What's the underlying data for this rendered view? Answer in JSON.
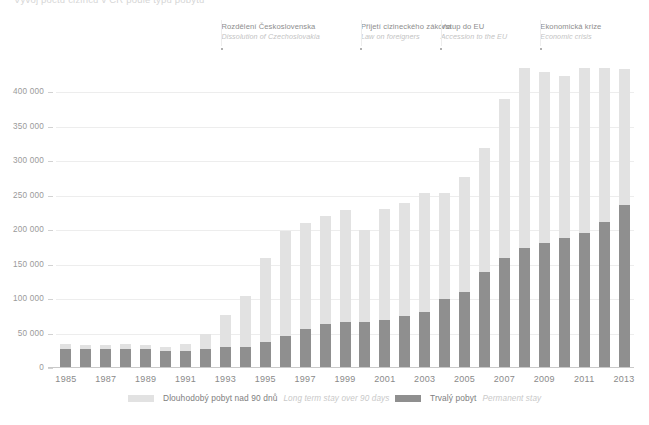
{
  "header": {
    "cutoff_title": "Vývoj počtu cizinců v ČR podle typu pobytu"
  },
  "annotations": [
    {
      "cz": "Rozdělení Československa",
      "en": "Dissolution of Czechoslovakia",
      "year": 1993
    },
    {
      "cz": "Přijetí cizineckého zákona",
      "en": "Law on foreigners",
      "year": 2000
    },
    {
      "cz": "Vstup do EU",
      "en": "Accession to the EU",
      "year": 2004
    },
    {
      "cz": "Ekonomická krize",
      "en": "Economic crisis",
      "year": 2009
    }
  ],
  "legend": {
    "items": [
      {
        "cz": "Dlouhodobý pobyt nad 90 dnů",
        "en": "Long term stay over 90 days",
        "color": "#e2e2e2",
        "key": "long_term"
      },
      {
        "cz": "Trvalý pobyt",
        "en": "Permanent stay",
        "color": "#8f8f8f",
        "key": "permanent"
      }
    ]
  },
  "colors": {
    "long_term": "#e2e2e2",
    "permanent": "#8f8f8f",
    "grid": "#ededed",
    "axis": "#c9c9c9",
    "tick_text": "#8a8a8a"
  },
  "chart_data": {
    "type": "bar",
    "stacked": true,
    "title": "Vývoj počtu cizinců v ČR podle typu pobytu",
    "xlabel": "",
    "ylabel": "",
    "ylim": [
      0,
      450000
    ],
    "ytick_step": 50000,
    "ytick_labels": [
      "0",
      "50 000",
      "100 000",
      "150 000",
      "200 000",
      "250 000",
      "300 000",
      "350 000",
      "400 000"
    ],
    "ytick_values": [
      0,
      50000,
      100000,
      150000,
      200000,
      250000,
      300000,
      350000,
      400000
    ],
    "grid": true,
    "legend_position": "bottom",
    "categories": [
      1985,
      1986,
      1987,
      1988,
      1989,
      1990,
      1991,
      1992,
      1993,
      1994,
      1995,
      1996,
      1997,
      1998,
      1999,
      2000,
      2001,
      2002,
      2003,
      2004,
      2005,
      2006,
      2007,
      2008,
      2009,
      2010,
      2011,
      2012,
      2013
    ],
    "xtick_labels": [
      "1985",
      "1987",
      "1989",
      "1991",
      "1993",
      "1995",
      "1997",
      "1999",
      "2001",
      "2003",
      "2005",
      "2007",
      "2009",
      "2011",
      "2013"
    ],
    "series": [
      {
        "name": "Trvalý pobyt",
        "name_en": "Permanent stay",
        "key": "permanent",
        "color": "#8f8f8f",
        "values": [
          28000,
          27000,
          27000,
          28000,
          27000,
          24000,
          25000,
          27000,
          31000,
          31000,
          38000,
          47000,
          56000,
          64000,
          67000,
          67000,
          70000,
          76000,
          81000,
          100000,
          111000,
          140000,
          159000,
          174000,
          181000,
          189000,
          196000,
          212000,
          236000
        ]
      },
      {
        "name": "Dlouhodobý pobyt nad 90 dnů",
        "name_en": "Long term stay over 90 days",
        "key": "long_term",
        "color": "#e2e2e2",
        "values": [
          7000,
          6000,
          6000,
          7000,
          7000,
          7000,
          10000,
          22000,
          46000,
          74000,
          122000,
          152000,
          154000,
          156000,
          162000,
          134000,
          161000,
          164000,
          173000,
          154000,
          167000,
          180000,
          232000,
          261000,
          249000,
          235000,
          240000,
          223000,
          198000
        ]
      }
    ],
    "totals": [
      35000,
      33000,
      33000,
      35000,
      34000,
      31000,
      35000,
      49000,
      77000,
      105000,
      160000,
      199000,
      210000,
      220000,
      229000,
      201000,
      231000,
      240000,
      254000,
      254000,
      278000,
      320000,
      391000,
      435000,
      430000,
      424000,
      436000,
      435000,
      434000
    ]
  }
}
